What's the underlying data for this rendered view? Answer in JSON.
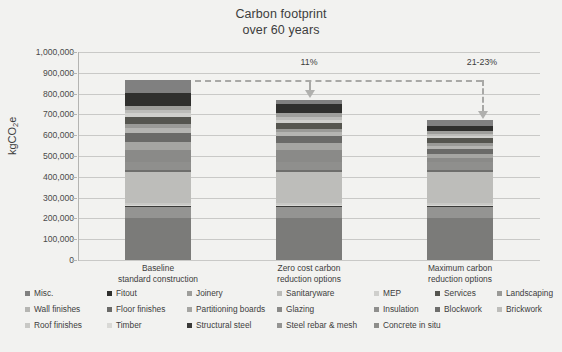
{
  "title": {
    "line1": "Carbon footprint",
    "line2": "over 60 years"
  },
  "axis": {
    "y_title_main": "kgCO",
    "y_title_sub": "2",
    "y_title_tail": "e",
    "y_ticks": [
      "1,000,000",
      "900,000",
      "800,000",
      "700,000",
      "600,000",
      "500,000",
      "400,000",
      "300,000",
      "200,000",
      "100,000",
      "0"
    ],
    "y_min": 0,
    "y_max": 1000000
  },
  "annotations": [
    {
      "name": "reduction-1",
      "label": "11%"
    },
    {
      "name": "reduction-2",
      "label": "21-23%"
    }
  ],
  "chart_data": {
    "type": "bar",
    "subtype": "stacked",
    "title": "Carbon footprint over 60 years",
    "xlabel": "",
    "ylabel": "kgCO2e",
    "ylim": [
      0,
      1000000
    ],
    "ytick_step": 100000,
    "grid": true,
    "legend_position": "bottom",
    "categories": [
      "Baseline\nstandard construction",
      "Zero cost carbon\nreduction options",
      "Maximum carbon\nreduction options"
    ],
    "category_lines": [
      [
        "Baseline",
        "standard construction"
      ],
      [
        "Zero cost carbon",
        "reduction options"
      ],
      [
        "Maximum carbon",
        "reduction options"
      ]
    ],
    "totals": [
      865000,
      770000,
      670000
    ],
    "annotation_values": [
      "11%",
      "21-23%"
    ],
    "series": [
      {
        "name": "Concrete in situ",
        "color": "#7b7b79",
        "values": [
          200000,
          200000,
          200000
        ]
      },
      {
        "name": "Steel rebar & mesh",
        "color": "#949492",
        "values": [
          55000,
          55000,
          55000
        ]
      },
      {
        "name": "Structural steel",
        "color": "#3a3a38",
        "values": [
          6000,
          6000,
          6000
        ]
      },
      {
        "name": "Timber",
        "color": "#d9d9d6",
        "values": [
          5000,
          5000,
          5000
        ]
      },
      {
        "name": "Roof finishes",
        "color": "#c8c8c5",
        "values": [
          6000,
          6000,
          6000
        ]
      },
      {
        "name": "Brickwork",
        "color": "#bdbdba",
        "values": [
          150000,
          150000,
          150000
        ]
      },
      {
        "name": "Blockwork",
        "color": "#6e6e6c",
        "values": [
          9000,
          9000,
          9000
        ]
      },
      {
        "name": "Insulation",
        "color": "#8f8f8d",
        "values": [
          42000,
          42000,
          42000
        ]
      },
      {
        "name": "Glazing",
        "color": "#8a8a88",
        "values": [
          58000,
          58000,
          20000
        ]
      },
      {
        "name": "Partitioning boards",
        "color": "#a5a5a2",
        "values": [
          38000,
          30000,
          18000
        ]
      },
      {
        "name": "Floor finishes",
        "color": "#6a6a68",
        "values": [
          40000,
          34000,
          22000
        ]
      },
      {
        "name": "Wall finishes",
        "color": "#b5b5b2",
        "values": [
          28000,
          22000,
          16000
        ]
      },
      {
        "name": "Landscaping",
        "color": "#9a9a97",
        "values": [
          18000,
          14000,
          12000
        ]
      },
      {
        "name": "Services",
        "color": "#55554f",
        "values": [
          34000,
          30000,
          24000
        ]
      },
      {
        "name": "MEP",
        "color": "#cfcfcc",
        "values": [
          18000,
          15000,
          12000
        ]
      },
      {
        "name": "Sanitaryware",
        "color": "#bcbcb9",
        "values": [
          14000,
          12000,
          10000
        ]
      },
      {
        "name": "Joinery",
        "color": "#9e9e9b",
        "values": [
          22000,
          18000,
          14000
        ]
      },
      {
        "name": "Fitout",
        "color": "#2f2f2d",
        "values": [
          62000,
          44000,
          22000
        ]
      },
      {
        "name": "Misc.",
        "color": "#808080",
        "values": [
          60000,
          20000,
          32000
        ]
      }
    ]
  },
  "legend": {
    "rows": [
      [
        {
          "label": "Misc.",
          "color": "#808080"
        },
        {
          "label": "Fitout",
          "color": "#2f2f2d"
        },
        {
          "label": "Joinery",
          "color": "#9e9e9b"
        },
        {
          "label": "Sanitaryware",
          "color": "#bcbcb9"
        },
        {
          "label": "MEP",
          "color": "#cfcfcc"
        },
        {
          "label": "Services",
          "color": "#55554f"
        },
        {
          "label": "Landscaping",
          "color": "#9a9a97"
        }
      ],
      [
        {
          "label": "Wall finishes",
          "color": "#b5b5b2"
        },
        {
          "label": "Floor finishes",
          "color": "#6a6a68"
        },
        {
          "label": "Partitioning boards",
          "color": "#a5a5a2"
        },
        {
          "label": "Glazing",
          "color": "#8a8a88"
        },
        {
          "label": "Insulation",
          "color": "#8f8f8d"
        },
        {
          "label": "Blockwork",
          "color": "#6e6e6c"
        },
        {
          "label": "Brickwork",
          "color": "#bdbdba"
        }
      ],
      [
        {
          "label": "Roof finishes",
          "color": "#c8c8c5"
        },
        {
          "label": "Timber",
          "color": "#d9d9d6"
        },
        {
          "label": "Structural steel",
          "color": "#3a3a38"
        },
        {
          "label": "Steel rebar & mesh",
          "color": "#949492"
        },
        {
          "label": "Concrete in situ",
          "color": "#8d8d8a"
        }
      ]
    ]
  },
  "colors": {
    "background": "#f2f2f0",
    "gridline": "#c9c9c7",
    "text": "#3d3d3d",
    "arrow": "#a8a8a6"
  }
}
